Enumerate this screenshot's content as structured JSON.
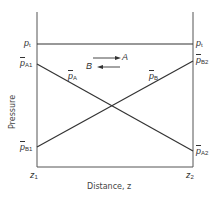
{
  "diagram": {
    "type": "pressure-distance profile",
    "colors": {
      "line": "#333333",
      "frame": "#555555",
      "text": "#333333"
    },
    "axes": {
      "y_label": "Pressure",
      "x_label": "Distance, z",
      "x_ticks": [
        {
          "main": "z",
          "sub": "1"
        },
        {
          "main": "z",
          "sub": "2"
        }
      ]
    },
    "left_labels": {
      "total_pressure": {
        "main": "p",
        "sub": "t"
      },
      "pA1": {
        "main": "p",
        "bar": true,
        "sub": "A1"
      },
      "pB1": {
        "main": "p",
        "bar": true,
        "sub": "B1"
      }
    },
    "right_labels": {
      "total_pressure": {
        "main": "p",
        "sub": "t"
      },
      "pB2": {
        "main": "p",
        "bar": true,
        "sub": "B2"
      },
      "pA2": {
        "main": "p",
        "bar": true,
        "sub": "A2"
      }
    },
    "line_labels": {
      "pA": {
        "main": "p",
        "bar": true,
        "sub": "A"
      },
      "pB": {
        "main": "p",
        "bar": true,
        "sub": "B"
      }
    },
    "flux_arrows": [
      {
        "species": "A",
        "direction": "right"
      },
      {
        "species": "B",
        "direction": "left"
      }
    ],
    "lines": [
      {
        "name": "total-pressure-line",
        "from": [
          37,
          44
        ],
        "to": [
          193,
          44
        ]
      },
      {
        "name": "partial-pressure-A-line",
        "from": [
          37,
          64
        ],
        "to": [
          193,
          151
        ]
      },
      {
        "name": "partial-pressure-B-line",
        "from": [
          37,
          147
        ],
        "to": [
          193,
          61
        ]
      }
    ]
  }
}
